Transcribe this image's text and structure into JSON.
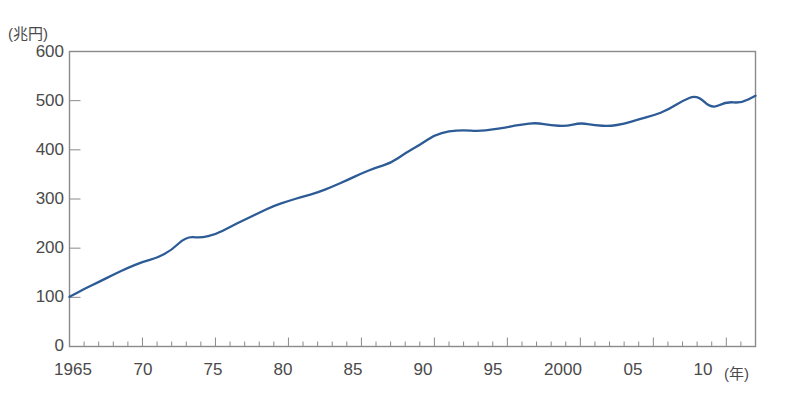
{
  "chart_data": {
    "type": "line",
    "title": "",
    "subtitle": "",
    "xlabel": "(年)",
    "ylabel": "(兆円)",
    "unit_y": "(兆円)",
    "unit_x": "(年)",
    "xlim": [
      1965,
      2012
    ],
    "ylim": [
      0,
      600
    ],
    "yticks": [
      0,
      100,
      200,
      300,
      400,
      500,
      600
    ],
    "ytick_labels": [
      "0",
      "100",
      "200",
      "300",
      "400",
      "500",
      "600"
    ],
    "xticks": [
      1965,
      1970,
      1975,
      1980,
      1985,
      1990,
      1995,
      2000,
      2005,
      2010
    ],
    "xtick_labels": [
      "1965",
      "70",
      "75",
      "80",
      "85",
      "90",
      "95",
      "2000",
      "05",
      "10"
    ],
    "minor_tick_interval": 1,
    "grid": false,
    "legend": "none",
    "line_color": "#2d5b96",
    "frame_color": "#8a8a8a",
    "series": [
      {
        "name": "名目GDP",
        "x": [
          1965,
          1966,
          1967,
          1968,
          1969,
          1970,
          1971,
          1972,
          1973,
          1974,
          1975,
          1976,
          1977,
          1978,
          1979,
          1980,
          1981,
          1982,
          1983,
          1984,
          1985,
          1986,
          1987,
          1988,
          1989,
          1990,
          1991,
          1992,
          1993,
          1994,
          1995,
          1996,
          1997,
          1998,
          1999,
          2000,
          2001,
          2002,
          2003,
          2004,
          2005,
          2006,
          2007,
          2008,
          2009,
          2010,
          2011,
          2012
        ],
        "values": [
          101,
          117,
          131,
          146,
          160,
          172,
          180,
          196,
          224,
          221,
          228,
          243,
          258,
          272,
          286,
          296,
          305,
          313,
          325,
          338,
          352,
          364,
          373,
          393,
          410,
          430,
          438,
          440,
          438,
          441,
          446,
          452,
          455,
          450,
          448,
          455,
          450,
          448,
          453,
          462,
          470,
          481,
          500,
          512,
          483,
          498,
          495,
          510
        ]
      }
    ],
    "annotations": []
  }
}
